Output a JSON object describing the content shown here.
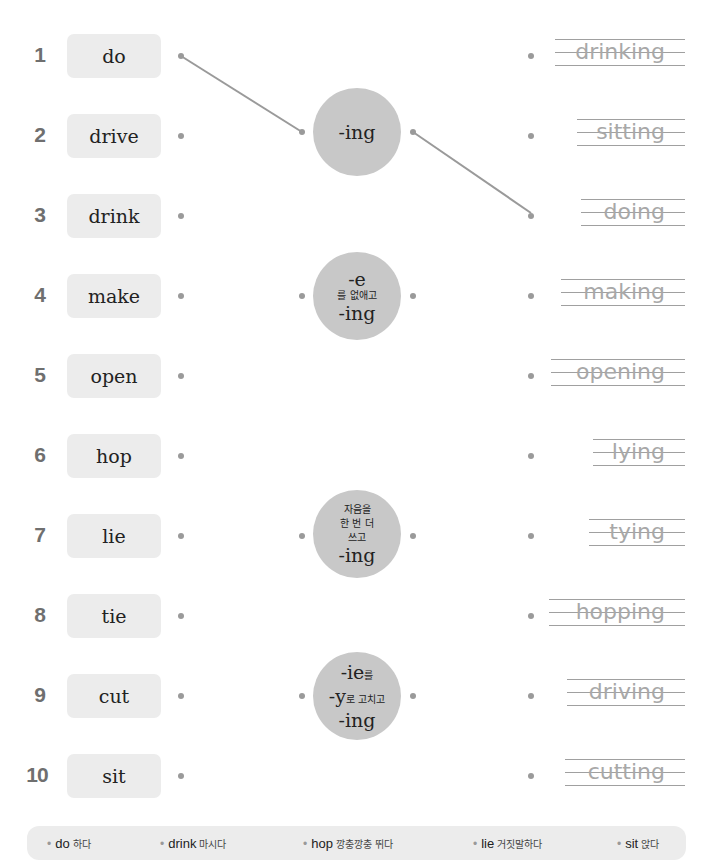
{
  "exercise": {
    "rows": [
      {
        "number": "1",
        "word": "do",
        "answer": "drinking"
      },
      {
        "number": "2",
        "word": "drive",
        "answer": "sitting"
      },
      {
        "number": "3",
        "word": "drink",
        "answer": "doing"
      },
      {
        "number": "4",
        "word": "make",
        "answer": "making"
      },
      {
        "number": "5",
        "word": "open",
        "answer": "opening"
      },
      {
        "number": "6",
        "word": "hop",
        "answer": "lying"
      },
      {
        "number": "7",
        "word": "lie",
        "answer": "tying"
      },
      {
        "number": "8",
        "word": "tie",
        "answer": "hopping"
      },
      {
        "number": "9",
        "word": "cut",
        "answer": "driving"
      },
      {
        "number": "10",
        "word": "sit",
        "answer": "cutting"
      }
    ],
    "rules": [
      {
        "id": "ing",
        "lines": [
          "-ing"
        ]
      },
      {
        "id": "drop-e",
        "line1": "-e",
        "line2": "를 없애고",
        "line3": "-ing"
      },
      {
        "id": "double-consonant",
        "line1": "자음을",
        "line2": "한 번 더",
        "line3": "쓰고",
        "line4": "-ing"
      },
      {
        "id": "ie-to-y",
        "line1_en": "-ie",
        "line1_ko": "를",
        "line2_en": "-y",
        "line2_ko": "로 고치고",
        "line3": "-ing"
      }
    ],
    "rule_ing_label": "-ing",
    "connections": [
      {
        "from": "word-1-do",
        "to": "rule-ing"
      },
      {
        "from": "rule-ing",
        "to": "answer-3-doing"
      }
    ]
  },
  "vocabulary": [
    {
      "bullet": "•",
      "en": "do",
      "ko": "하다"
    },
    {
      "bullet": "•",
      "en": "drink",
      "ko": "마시다"
    },
    {
      "bullet": "•",
      "en": "hop",
      "ko": "깡충깡충 뛰다"
    },
    {
      "bullet": "•",
      "en": "lie",
      "ko": "거짓말하다"
    },
    {
      "bullet": "•",
      "en": "sit",
      "ko": "앉다"
    }
  ],
  "colors": {
    "word_box_bg": "#ececec",
    "circle_bg": "#c8c8c8",
    "trace_text": "#a8a8a8",
    "line_color": "#999999",
    "number_color": "#6f6f6f"
  }
}
